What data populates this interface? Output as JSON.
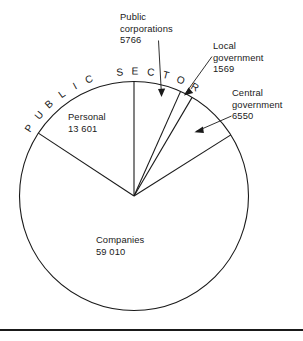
{
  "chart_data": {
    "type": "pie",
    "title": "",
    "categories": [
      "Public corporations",
      "Local government",
      "Central government",
      "Companies",
      "Personal"
    ],
    "values": [
      5766,
      1569,
      6550,
      59010,
      13601
    ],
    "total": 86496,
    "start_angle_deg": 0,
    "direction": "clockwise",
    "grid": false,
    "legend": "none",
    "annotations": [
      {
        "text": "PUBLIC SECTOR",
        "placement": "curved-along-top-arc",
        "covers": [
          "Public corporations",
          "Local government",
          "Central government"
        ]
      }
    ],
    "slices": [
      {
        "label": "Public corporations",
        "value": 5766,
        "start_deg": 0.0,
        "end_deg": 24.0,
        "label_placement": "outside-top",
        "leader": "arrow"
      },
      {
        "label": "Local government",
        "value": 1569,
        "start_deg": 24.0,
        "end_deg": 30.5,
        "label_placement": "outside-top-right",
        "leader": "arrow"
      },
      {
        "label": "Central government",
        "value": 6550,
        "start_deg": 30.5,
        "end_deg": 57.8,
        "label_placement": "outside-right",
        "leader": "arrow"
      },
      {
        "label": "Companies",
        "value": 59010,
        "start_deg": 57.8,
        "end_deg": 303.4,
        "label_placement": "inside",
        "leader": "none"
      },
      {
        "label": "Personal",
        "value": 13601,
        "start_deg": 303.4,
        "end_deg": 360.0,
        "label_placement": "inside",
        "leader": "none"
      }
    ],
    "colors": {
      "fill": "#ffffff",
      "stroke": "#1a1a1a",
      "text": "#1a1a1a"
    }
  },
  "labels": {
    "public_corporations": {
      "line1": "Public",
      "line2": "corporations",
      "value": "5766"
    },
    "local_government": {
      "line1": "Local",
      "line2": "government",
      "value": "1569"
    },
    "central_government": {
      "line1": "Central",
      "line2": "government",
      "value": "6550"
    },
    "personal": {
      "line1": "Personal",
      "value": "13 601"
    },
    "companies": {
      "line1": "Companies",
      "value": "59 010"
    },
    "public_sector_arc": {
      "text": "PUBLIC SECTOR"
    }
  }
}
